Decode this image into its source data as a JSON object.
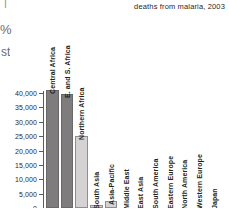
{
  "caption": {
    "text": "deaths from malaria, 2003"
  },
  "edge_fragments": {
    "tick": "|",
    "percent": "%",
    "st": "st"
  },
  "chart_data": {
    "type": "bar",
    "title": "",
    "subtitle": "",
    "xlabel": "",
    "ylabel": "",
    "ylim": [
      0,
      40000
    ],
    "grid": false,
    "legend": "none",
    "ytick_labels": [
      "40,000",
      "35,000",
      "30,000",
      "25,000",
      "20,000",
      "15,000",
      "10,000",
      "5,000",
      "0"
    ],
    "ytick_values": [
      40000,
      35000,
      30000,
      25000,
      20000,
      15000,
      10000,
      5000,
      0
    ],
    "categories": [
      "Central Africa",
      "E. and S. Africa",
      "Northern Africa",
      "South Asia",
      "Asia-Pacific",
      "Middle East",
      "East Asia",
      "South America",
      "Eastern Europe",
      "North America",
      "Western Europe",
      "Japan"
    ],
    "values": [
      41000,
      39500,
      25200,
      1100,
      2400,
      0,
      0,
      0,
      0,
      0,
      0,
      0
    ],
    "bar_colors": [
      "#7e7c7c",
      "#7e7c7c",
      "#d4d2d2",
      "#d4d2d2",
      "#d4d2d2",
      "#d4d2d2",
      "#d4d2d2",
      "#d4d2d2",
      "#d4d2d2",
      "#d4d2d2",
      "#d4d2d2",
      "#d4d2d2"
    ],
    "colors": {
      "dark_bar": "#7e7c7c",
      "light_bar": "#d4d2d2",
      "axis": "#5d5a5a",
      "text": "#231f20",
      "background": "#ffffff"
    }
  }
}
